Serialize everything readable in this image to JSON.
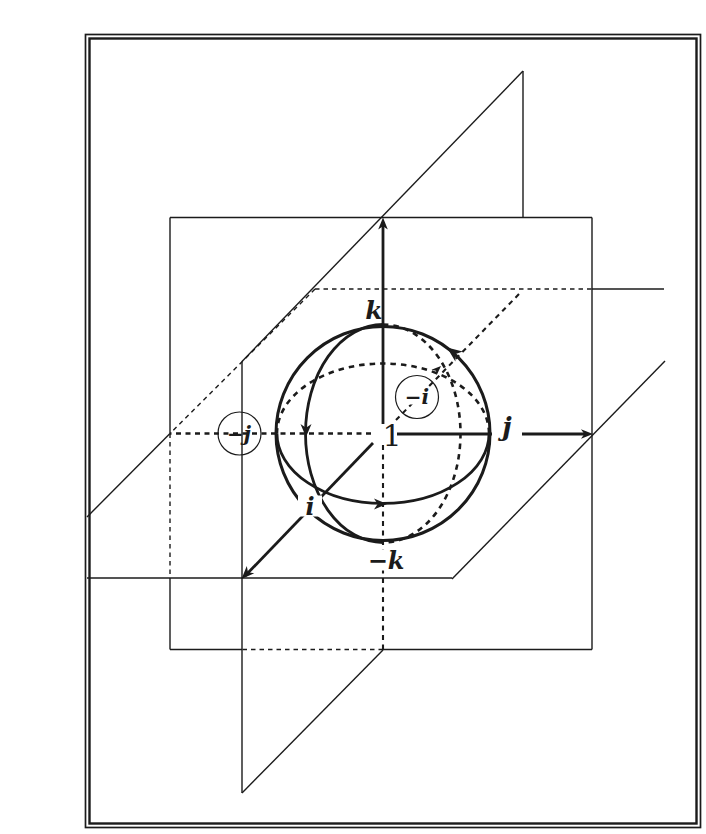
{
  "meta": {
    "bg_color": "#ffffff",
    "ink_color": "#1b1b1b",
    "canvas": {
      "width": 682,
      "height": 834
    }
  },
  "frame": {
    "rects": [
      {
        "name": "frame-outer",
        "x": 45.5,
        "y": 18.5,
        "w": 615,
        "h": 793,
        "sw": 1.7
      },
      {
        "name": "frame-inner",
        "x": 49.5,
        "y": 22.5,
        "w": 607,
        "h": 785,
        "sw": 2.4
      }
    ]
  },
  "diagram": {
    "dash_styles": {
      "thin": "4.5 4",
      "axis": "5 4.5",
      "curve": "5.5 5"
    },
    "lines": [
      {
        "name": "front-plane-top-edge",
        "x1": 130,
        "y1": 201.5,
        "x2": 552,
        "y2": 201.5,
        "w": 1.4
      },
      {
        "name": "front-plane-right-edge",
        "x1": 552,
        "y1": 201.5,
        "x2": 552,
        "y2": 633.5,
        "w": 1.4
      },
      {
        "name": "front-plane-bottom-edge-right",
        "x1": 552,
        "y1": 633.5,
        "x2": 343,
        "y2": 633.5,
        "w": 1.4
      },
      {
        "name": "front-plane-bottom-edge-hidden",
        "x1": 343,
        "y1": 633.5,
        "x2": 202,
        "y2": 633.5,
        "w": 1.4,
        "dash": "thin"
      },
      {
        "name": "front-plane-bottom-edge-left",
        "x1": 202,
        "y1": 633.5,
        "x2": 130,
        "y2": 633.5,
        "w": 1.4
      },
      {
        "name": "front-plane-left-edge-top",
        "x1": 130,
        "y1": 201.5,
        "x2": 130,
        "y2": 417.5,
        "w": 1.4
      },
      {
        "name": "front-plane-left-edge-hidden",
        "x1": 130,
        "y1": 417.5,
        "x2": 130,
        "y2": 562,
        "w": 1.4,
        "dash": "thin"
      },
      {
        "name": "front-plane-left-edge-bottom",
        "x1": 130,
        "y1": 562,
        "x2": 130,
        "y2": 633.5,
        "w": 1.4
      },
      {
        "name": "slanted-plane-upper-diagonal",
        "x1": 202,
        "y1": 345.5,
        "x2": 483,
        "y2": 55,
        "w": 1.4
      },
      {
        "name": "slanted-plane-right-edge",
        "x1": 483,
        "y1": 55,
        "x2": 483,
        "y2": 201.5,
        "w": 1.4
      },
      {
        "name": "slanted-plane-left-edge",
        "x1": 202,
        "y1": 345.5,
        "x2": 202,
        "y2": 777,
        "w": 1.4
      },
      {
        "name": "slanted-plane-lower-diagonal-front",
        "x1": 202,
        "y1": 777,
        "x2": 343,
        "y2": 634,
        "w": 1.4
      },
      {
        "name": "slanted-plane-lower-diagonal-right",
        "x1": 412,
        "y1": 563,
        "x2": 625,
        "y2": 345,
        "w": 1.4
      },
      {
        "name": "horizontal-plane-back-edge-hidden",
        "x1": 275,
        "y1": 273,
        "x2": 552,
        "y2": 273,
        "w": 1.4,
        "dash": "thin"
      },
      {
        "name": "horizontal-plane-back-edge-right",
        "x1": 552,
        "y1": 273,
        "x2": 624,
        "y2": 273,
        "w": 1.4
      },
      {
        "name": "horizontal-plane-left-edge-hidden",
        "x1": 275,
        "y1": 273,
        "x2": 130,
        "y2": 417.5,
        "w": 1.4,
        "dash": "thin"
      },
      {
        "name": "horizontal-plane-left-edge-front",
        "x1": 130,
        "y1": 417.5,
        "x2": 47,
        "y2": 501,
        "w": 1.4
      },
      {
        "name": "horizontal-plane-front-edge",
        "x1": 47,
        "y1": 562,
        "x2": 412,
        "y2": 562,
        "w": 1.4
      },
      {
        "name": "minus-j-axis-dashed",
        "x1": 331,
        "y1": 417.5,
        "x2": 130,
        "y2": 417.5,
        "w": 2.3,
        "dash": "axis"
      },
      {
        "name": "minus-k-axis-dashed",
        "x1": 343,
        "y1": 429,
        "x2": 343,
        "y2": 633,
        "w": 2.1,
        "dash": "axis"
      },
      {
        "name": "minus-i-axis-dashed",
        "x1": 356,
        "y1": 404,
        "x2": 481,
        "y2": 276,
        "w": 2.1,
        "dash": "axis"
      },
      {
        "name": "k-axis-shaft",
        "x1": 343,
        "y1": 408,
        "x2": 343,
        "y2": 206,
        "w": 2.8
      },
      {
        "name": "j-axis-shaft",
        "x1": 357,
        "y1": 418,
        "x2": 548,
        "y2": 418,
        "w": 2.8
      },
      {
        "name": "i-axis-shaft",
        "x1": 333,
        "y1": 427,
        "x2": 205,
        "y2": 560,
        "w": 2.8
      }
    ],
    "sphere_outline": {
      "name": "sphere-outline-circle",
      "cx": 343,
      "cy": 417.5,
      "r": 107,
      "w": 3
    },
    "arcs": [
      {
        "name": "meridian-great-circle-front",
        "cx": 343,
        "cy": 417.5,
        "rx": 77.5,
        "ry": 109,
        "half": "left",
        "w": 2.8
      },
      {
        "name": "meridian-great-circle-back",
        "cx": 343,
        "cy": 417.5,
        "rx": 77.5,
        "ry": 109,
        "half": "right",
        "w": 2.6,
        "dash": "curve"
      },
      {
        "name": "equator-great-circle-front",
        "cx": 343,
        "cy": 417.5,
        "rx": 106,
        "ry": 70,
        "half": "bottom",
        "w": 2.7
      },
      {
        "name": "equator-great-circle-back",
        "cx": 343,
        "cy": 417.5,
        "rx": 106,
        "ry": 70,
        "half": "top",
        "w": 2.6,
        "dash": "curve"
      }
    ],
    "arrowheads": [
      {
        "name": "k-axis-arrowhead",
        "x": 343,
        "y": 201.5,
        "angle": -90,
        "l": 12,
        "w": 4.8
      },
      {
        "name": "j-axis-arrowhead",
        "x": 553,
        "y": 418,
        "angle": 0,
        "l": 12,
        "w": 4.8
      },
      {
        "name": "i-axis-arrowhead",
        "x": 201.5,
        "y": 563,
        "angle": 134,
        "l": 13,
        "w": 5.2
      },
      {
        "name": "minus-i-arrowhead",
        "x": 401,
        "y": 350,
        "angle": -43,
        "l": 9.5,
        "w": 3.8
      },
      {
        "name": "outline-rotation-arrowhead",
        "x": 407,
        "y": 331.5,
        "angle": -143.5,
        "l": 15,
        "w": 6.2
      },
      {
        "name": "meridian-rotation-arrowhead",
        "x": 266,
        "y": 421,
        "angle": 90,
        "l": 13,
        "w": 5.5
      },
      {
        "name": "equator-rotation-arrowhead",
        "x": 347,
        "y": 488,
        "angle": 0,
        "l": 13,
        "w": 5.5
      }
    ],
    "label_circles": [
      {
        "name": "circle-around-minus-j",
        "cx": 199.5,
        "cy": 417.5,
        "r": 21.5,
        "sw": 1.2
      },
      {
        "name": "circle-around-minus-i",
        "cx": 377,
        "cy": 381,
        "r": 21.5,
        "sw": 1.2
      }
    ],
    "labels": [
      {
        "name": "label-k",
        "x": 334,
        "y": 294,
        "text": "k",
        "size": 25,
        "bold": true,
        "italic": true
      },
      {
        "name": "label-minus-k",
        "x": 346,
        "y": 544,
        "text": "−k",
        "size": 24,
        "bold": true,
        "italic": true,
        "bg": [
          46,
          21
        ]
      },
      {
        "name": "label-j",
        "x": 467,
        "y": 411,
        "text": "j",
        "size": 26,
        "bold": true,
        "italic": true,
        "bg": [
          30,
          26
        ]
      },
      {
        "name": "label-i",
        "x": 270,
        "y": 490,
        "text": "i",
        "size": 24,
        "bold": true,
        "italic": true,
        "bg": [
          24,
          21
        ]
      },
      {
        "name": "label-one",
        "x": 352,
        "y": 419,
        "text": "1",
        "size": 30,
        "bold": false,
        "italic": false
      },
      {
        "name": "label-minus-j",
        "x": 199,
        "y": 418,
        "text": "−j",
        "size": 20,
        "bold": true,
        "italic": true
      },
      {
        "name": "label-minus-i",
        "x": 377,
        "y": 381,
        "text": "−i",
        "size": 20,
        "bold": true,
        "italic": true,
        "bg": [
          28,
          15
        ]
      }
    ]
  }
}
